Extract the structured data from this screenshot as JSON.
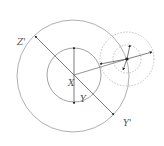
{
  "diagram": {
    "type": "geometric-nested-circles",
    "colors": {
      "stroke": "#8a8a8a",
      "dashed": "#b0b0b0",
      "arrow": "#222222",
      "label": "#555555"
    },
    "labels": {
      "center": "X",
      "inner_radius": "Y",
      "outer_diameter_start": "Z'",
      "outer_diameter_end": "Y'"
    },
    "circles": [
      {
        "name": "outer-circle",
        "cx": 73,
        "cy": 76,
        "r": 56,
        "style": "solid"
      },
      {
        "name": "inner-circle",
        "cx": 74,
        "cy": 75,
        "r": 27,
        "style": "solid"
      },
      {
        "name": "satellite-outer-circle",
        "cx": 127,
        "cy": 59,
        "r": 27,
        "style": "dashed"
      },
      {
        "name": "satellite-inner-circle",
        "cx": 127,
        "cy": 59,
        "r": 14,
        "style": "dashed"
      }
    ]
  }
}
